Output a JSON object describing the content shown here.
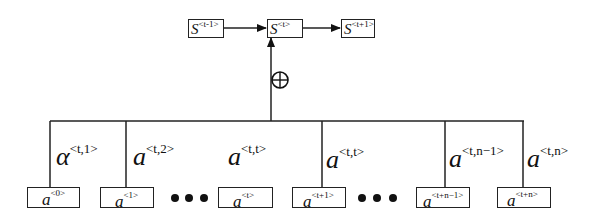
{
  "top_states": [
    {
      "base": "S",
      "sup": "<t-1>"
    },
    {
      "base": "S",
      "sup": "<t>"
    },
    {
      "base": "S",
      "sup": "<t+1>"
    }
  ],
  "combine_symbol": "⊕",
  "weights": [
    {
      "base": "α",
      "sup": "<t,1>"
    },
    {
      "base": "a",
      "sup": "<t,2>"
    },
    {
      "base": "a",
      "sup": "<t,t>"
    },
    {
      "base": "a",
      "sup": "<t,t>"
    },
    {
      "base": "a",
      "sup": "<t,n−1>"
    },
    {
      "base": "a",
      "sup": "<t,n>"
    }
  ],
  "inputs": [
    {
      "base": "a",
      "sup": "<0>"
    },
    {
      "base": "a",
      "sup": "<1>"
    },
    {
      "base": "a",
      "sup": "<t>"
    },
    {
      "base": "a",
      "sup": "<t+1>"
    },
    {
      "base": "a",
      "sup": "<t+n−1>"
    },
    {
      "base": "a",
      "sup": "<t+n>"
    }
  ],
  "ellipsis": "•••"
}
